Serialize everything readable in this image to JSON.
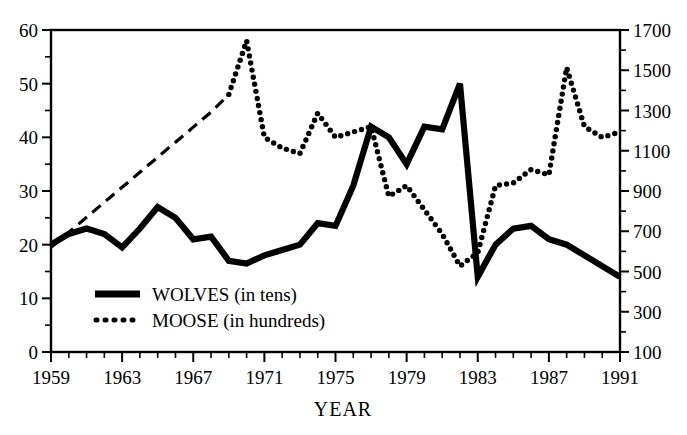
{
  "chart_data": {
    "type": "line",
    "title": "",
    "xlabel": "YEAR",
    "ylabel": "",
    "grid": false,
    "legend_position": "inside-lower-left",
    "x": [
      1959,
      1960,
      1961,
      1962,
      1963,
      1964,
      1965,
      1966,
      1967,
      1968,
      1969,
      1970,
      1971,
      1972,
      1973,
      1974,
      1975,
      1976,
      1977,
      1978,
      1979,
      1980,
      1981,
      1982,
      1983,
      1984,
      1985,
      1986,
      1987,
      1988,
      1989,
      1990,
      1991
    ],
    "xlim": [
      1959,
      1991
    ],
    "xtick_labels": [
      "1959",
      "1963",
      "1967",
      "1971",
      "1975",
      "1979",
      "1983",
      "1987",
      "1991"
    ],
    "xtick_values": [
      1959,
      1963,
      1967,
      1971,
      1975,
      1979,
      1983,
      1987,
      1991
    ],
    "xminor_step": 1,
    "left_axis": {
      "label": "",
      "lim": [
        0,
        60
      ],
      "tick_values": [
        0,
        10,
        20,
        30,
        40,
        50,
        60
      ],
      "tick_labels": [
        "0",
        "10",
        "20",
        "30",
        "40",
        "50",
        "60"
      ],
      "minor_step": 5
    },
    "right_axis": {
      "label": "",
      "lim": [
        100,
        1700
      ],
      "tick_values": [
        100,
        300,
        500,
        700,
        900,
        1100,
        1300,
        1500,
        1700
      ],
      "tick_labels": [
        "100",
        "300",
        "500",
        "700",
        "900",
        "1100",
        "1300",
        "1500",
        "1700"
      ],
      "minor_step": 100
    },
    "series": [
      {
        "name": "WOLVES (in tens)",
        "legend_label": "WOLVES (in tens)",
        "axis": "left",
        "style": "solid-thick",
        "units": "tens of wolves (left scale)",
        "values": [
          20,
          22,
          23,
          22,
          19.5,
          23,
          27,
          25,
          21,
          21.5,
          17,
          16.5,
          18,
          19,
          20,
          24,
          23.5,
          31,
          42,
          40,
          35,
          42,
          41.5,
          50,
          14,
          20,
          23,
          23.5,
          21,
          20,
          18,
          16,
          14
        ]
      },
      {
        "name": "MOOSE (in hundreds)",
        "legend_label": "MOOSE (in hundreds)",
        "axis": "left-mapped-to-right",
        "style": "dotted",
        "units": "hundreds of moose (right scale)",
        "interpolated_segment": "1959-1969 shown as dashed straight line (no survey data)",
        "values": [
          19.5,
          22.3,
          25.1,
          27.9,
          30.7,
          33.5,
          36.3,
          39.1,
          41.9,
          44.7,
          48,
          58,
          40,
          38,
          37,
          44.5,
          40,
          41,
          42,
          29,
          31,
          26.5,
          22,
          16,
          18.5,
          31,
          31.5,
          34,
          33,
          53,
          42,
          40,
          41
        ]
      }
    ],
    "notes": {
      "wolves_peak_year": 1981,
      "wolves_peak_value": 50,
      "wolves_crash_year": 1982,
      "wolves_crash_value": 14,
      "moose_peak_year": 1970,
      "moose_peak_value_hundreds": 58,
      "moose_second_peak_year": 1988,
      "moose_second_peak_value_hundreds": 53
    }
  },
  "legend": {
    "items": [
      {
        "label": "WOLVES (in tens)",
        "marker": "solid-line"
      },
      {
        "label": "MOOSE (in hundreds)",
        "marker": "dotted-line"
      }
    ]
  },
  "colors": {
    "ink": "#000000",
    "background": "#ffffff"
  }
}
